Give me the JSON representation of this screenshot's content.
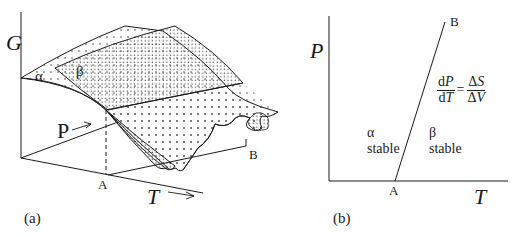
{
  "panel_a": {
    "caption": "(a)",
    "axis_g": "G",
    "axis_p": "P",
    "axis_t": "T",
    "surface_alpha": "α",
    "surface_beta": "β",
    "point_a": "A",
    "point_b": "B",
    "arrow_icon": "right-arrow"
  },
  "panel_b": {
    "caption": "(b)",
    "axis_p": "P",
    "axis_t": "T",
    "point_a": "A",
    "point_b": "B",
    "region_alpha": {
      "phase": "α",
      "label": "stable"
    },
    "region_beta": {
      "phase": "β",
      "label": "stable"
    },
    "equation": {
      "lhs_num": "dP",
      "lhs_den": "dT",
      "equals": "=",
      "rhs_num": "ΔS",
      "rhs_den": "ΔV"
    }
  },
  "colors": {
    "ink": "#1a1a1a",
    "background": "#ffffff"
  }
}
